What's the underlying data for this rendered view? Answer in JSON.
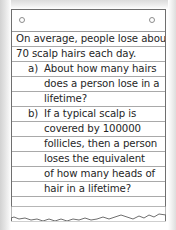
{
  "document": {
    "type": "ruled-notebook-paper",
    "paper": {
      "hole_count": 2,
      "bottom_edge": "torn",
      "rule_color": "#a9a9a9",
      "ink_color": "#262626",
      "paper_color": "#ffffff",
      "border_color": "#6f6f6f"
    },
    "problem": {
      "intro": [
        "On average, people lose about",
        "70 scalp hairs each day."
      ],
      "parts": [
        {
          "label": "a)",
          "lines": [
            "About how many hairs",
            "does a person lose in a",
            "lifetime?"
          ]
        },
        {
          "label": "b)",
          "lines": [
            "If a typical scalp is",
            "covered by 100000",
            "follicles, then a person",
            "loses the equivalent",
            "of how many heads of",
            "hair in a lifetime?"
          ]
        }
      ],
      "values": {
        "hairs_per_day": "70",
        "follicles_per_scalp": "100000"
      }
    }
  }
}
